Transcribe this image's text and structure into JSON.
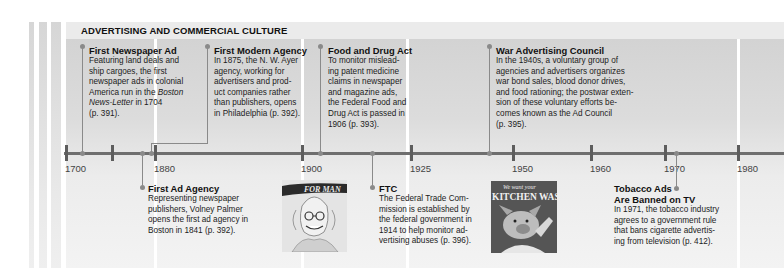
{
  "section_title": "ADVERTISING AND COMMERCIAL CULTURE",
  "axis": {
    "ticks": [
      {
        "label": "1700",
        "x": 66
      },
      {
        "label": "",
        "x": 112
      },
      {
        "label": "1880",
        "x": 155
      },
      {
        "label": "1900",
        "x": 302
      },
      {
        "label": "1925",
        "x": 411
      },
      {
        "label": "1950",
        "x": 513
      },
      {
        "label": "1960",
        "x": 591
      },
      {
        "label": "1970",
        "x": 665
      },
      {
        "label": "1980",
        "x": 738
      }
    ]
  },
  "events_above": [
    {
      "title": "First Newspaper Ad",
      "lines": [
        "Featuring land deals and",
        "ship cargoes, the first",
        "newspaper ads in colonial",
        "America run in the "
      ],
      "italic": "Boston",
      "italic2": "News-Letter",
      "tail": " in 1704",
      "ref": "(p. 391)."
    },
    {
      "title": "First Modern Agency",
      "lines": [
        "In 1875, the N. W. Ayer",
        "agency, working for",
        "advertisers and prod-",
        "uct companies rather",
        "than publishers, opens",
        "in Philadelphia (p. 392)."
      ]
    },
    {
      "title": "Food and Drug Act",
      "lines": [
        "To monitor mislead-",
        "ing patent medicine",
        "claims in newspaper",
        "and magazine ads,",
        "the Federal Food and",
        "Drug Act is passed in",
        "1906 (p. 393)."
      ]
    },
    {
      "title": "War Advertising Council",
      "lines": [
        "In the 1940s, a voluntary group of",
        "agencies and advertisers organizes",
        "war bond sales, blood donor drives,",
        "and food rationing; the postwar exten-",
        "sion of these voluntary efforts be-",
        "comes known as the Ad Council",
        "(p. 395)."
      ]
    }
  ],
  "events_below": [
    {
      "title": "First Ad Agency",
      "lines": [
        "Representing newspaper",
        "publishers, Volney Palmer",
        "opens the first ad agency in",
        "Boston in 1841 (p. 392)."
      ]
    },
    {
      "title": "FTC",
      "lines": [
        "The Federal Trade Com-",
        "mission is established by",
        "the federal government in",
        "1914 to help monitor ad-",
        "vertising abuses (p. 396)."
      ]
    },
    {
      "title_line1": "Tobacco Ads",
      "title_line2": "Are Banned on TV",
      "lines": [
        "In 1971, the tobacco industry",
        "agrees to a government rule",
        "that bans cigarette advertis-",
        "ing from television (p. 412)."
      ]
    }
  ],
  "images": [
    {
      "name": "magazine-cover-caricature",
      "caption_text": "FOR MAN"
    },
    {
      "name": "kitchen-waste-poster",
      "caption_text": "We want your KITCHEN WASTE"
    }
  ],
  "colors": {
    "panel_dark": "#d3d3d3",
    "panel_light": "#f3f3f3",
    "axis": "#6e6e6e",
    "connector": "#8a8a8a"
  }
}
